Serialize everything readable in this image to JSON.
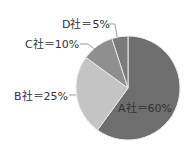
{
  "chart_data": {
    "type": "pie",
    "title": "",
    "categories": [
      "A社",
      "B社",
      "C社",
      "D社"
    ],
    "values": [
      60,
      25,
      10,
      5
    ],
    "labels": [
      "A社＝60%",
      "B社＝25%",
      "C社＝10%",
      "D社＝5%"
    ],
    "colors": [
      "#6e6e6e",
      "#c4c4c4",
      "#8f8f8f",
      "#7a7a7a"
    ],
    "start_angle": "top, clockwise",
    "legend": "none"
  }
}
